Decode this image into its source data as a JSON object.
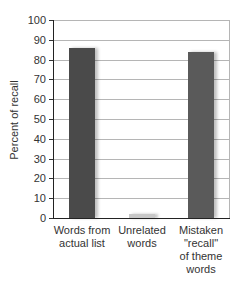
{
  "chart_data": {
    "type": "bar",
    "title": "",
    "xlabel": "",
    "ylabel": "Percent of recall",
    "ylim": [
      0,
      100
    ],
    "yticks": [
      0,
      10,
      20,
      30,
      40,
      50,
      60,
      70,
      80,
      90,
      100
    ],
    "grid": true,
    "legend": null,
    "categories": [
      "Words from actual list",
      "Unrelated words",
      "Mistaken \"recall\" of theme words"
    ],
    "category_lines": [
      [
        "Words from",
        "actual list"
      ],
      [
        "Unrelated",
        "words"
      ],
      [
        "Mistaken",
        "\"recall\"",
        "of theme",
        "words"
      ]
    ],
    "values": [
      86,
      2,
      84
    ],
    "colors": [
      "#4a4a4a",
      "#c8c8c8",
      "#5a5a5a"
    ]
  },
  "tick_labels": [
    "0",
    "10",
    "20",
    "30",
    "40",
    "50",
    "60",
    "70",
    "80",
    "90",
    "100"
  ]
}
